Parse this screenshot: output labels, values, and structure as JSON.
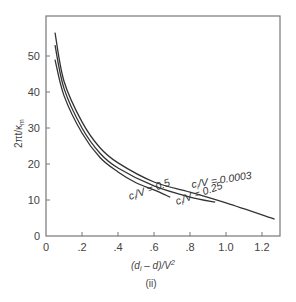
{
  "chart_data": {
    "type": "line",
    "title": "",
    "caption": "(ii)",
    "xlabel": "(d_i − d)/V²",
    "ylabel": "2πt/κ_m",
    "xlim": [
      0,
      1.3
    ],
    "ylim": [
      0,
      61
    ],
    "grid": false,
    "legend": "inline curve labels",
    "xticks": [
      0,
      0.2,
      0.4,
      0.6,
      0.8,
      1.0,
      1.2
    ],
    "xtick_labels": [
      "0",
      ".2",
      ".4",
      ".6",
      ".8",
      "1.0",
      "1.2"
    ],
    "yticks": [
      0,
      10,
      20,
      30,
      40,
      50
    ],
    "ytick_labels": [
      "0",
      "10",
      "20",
      "30",
      "40",
      "50"
    ],
    "series": [
      {
        "name": "c_i/V = 0.0003",
        "label": "c_i/V = 0.0003",
        "x": [
          0.05,
          0.1,
          0.2,
          0.3,
          0.4,
          0.6,
          0.8,
          1.0,
          1.27
        ],
        "y": [
          56.5,
          43,
          31.7,
          24.5,
          20.3,
          15.0,
          12.2,
          9.2,
          4.7
        ]
      },
      {
        "name": "c_i/V = 0.25",
        "label": "c_i/V = 0.25",
        "x": [
          0.05,
          0.1,
          0.2,
          0.3,
          0.4,
          0.6,
          0.8,
          0.94
        ],
        "y": [
          53,
          41,
          30.0,
          23.0,
          18.9,
          13.9,
          10.8,
          9.4
        ]
      },
      {
        "name": "c_i/V = 0.5",
        "label": "c_i/V = 0.5",
        "x": [
          0.05,
          0.1,
          0.2,
          0.3,
          0.4,
          0.5,
          0.6,
          0.69
        ],
        "y": [
          49,
          39,
          28.6,
          21.8,
          17.8,
          14.8,
          12.8,
          10.8
        ]
      }
    ]
  },
  "labels": {
    "ylabel_main": "2πt/κ",
    "ylabel_sub": "m",
    "xlabel_prefix": "(d",
    "xlabel_sub": "i",
    "xlabel_rest": " – d)/V",
    "xlabel_sup": "2",
    "caption": "(ii)",
    "curve1_a": "c",
    "curve1_sub": "i",
    "curve1_b": "/V = 0.0003",
    "curve2_a": "c",
    "curve2_sub": "i",
    "curve2_b": "/V = 0.25",
    "curve3_a": "c",
    "curve3_sub": "i",
    "curve3_b": "/V = 0.5"
  }
}
